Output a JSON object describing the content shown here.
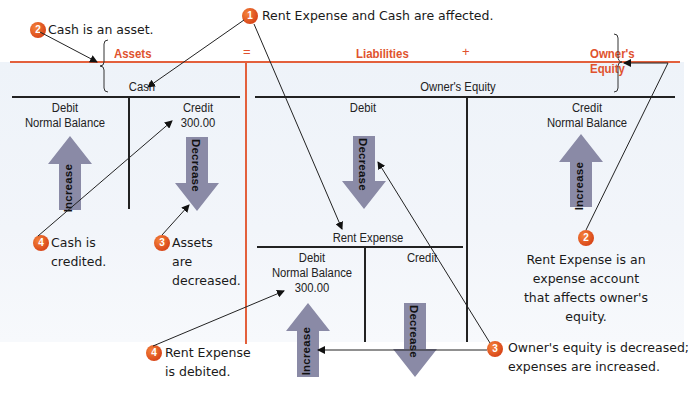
{
  "equation": {
    "assets": "Assets",
    "equals": "=",
    "liabilities": "Liabilities",
    "plus": "+",
    "owners_equity": "Owner's Equity"
  },
  "accounts": {
    "cash": {
      "title": "Cash",
      "debit_label": "Debit",
      "debit_note": "Normal Balance",
      "credit_label": "Credit",
      "credit_amount": "300.00",
      "increase_label": "Increase",
      "decrease_label": "Decrease"
    },
    "owners_equity": {
      "title": "Owner's Equity",
      "debit_label": "Debit",
      "credit_label": "Credit",
      "credit_note": "Normal Balance",
      "increase_label": "Increase",
      "decrease_label": "Decrease"
    },
    "rent_expense": {
      "title": "Rent Expense",
      "debit_label": "Debit",
      "debit_note": "Normal Balance",
      "debit_amount": "300.00",
      "credit_label": "Credit",
      "increase_label": "Increase",
      "decrease_label": "Decrease"
    }
  },
  "callouts": [
    {
      "step": "1",
      "text": "Rent Expense and Cash are affected."
    },
    {
      "step": "2",
      "text": "Cash is an asset."
    },
    {
      "step": "2",
      "lines": [
        "Rent Expense is an",
        "expense account",
        "that affects owner's",
        "equity."
      ]
    },
    {
      "step": "3",
      "lines": [
        "Assets",
        "are",
        "decreased."
      ]
    },
    {
      "step": "3",
      "lines": [
        "Owner's equity is decreased;",
        "expenses are increased."
      ]
    },
    {
      "step": "4",
      "lines": [
        "Cash is",
        "credited."
      ]
    },
    {
      "step": "4",
      "lines": [
        "Rent Expense",
        "is debited."
      ]
    }
  ],
  "colors": {
    "accent_red": "#e0522e",
    "badge_orange": "#e8602a",
    "arrow_gray": "#8a8aa6",
    "panel_bg": "#eef3f9"
  }
}
